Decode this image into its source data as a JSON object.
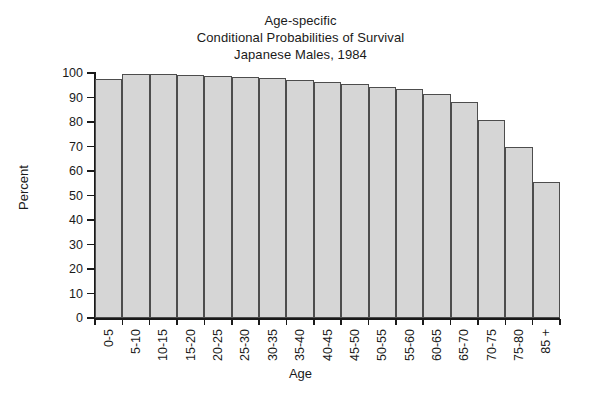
{
  "chart_data": {
    "type": "bar",
    "title": "Age-specific\nConditional Probabilities of Survival\nJapanese Males, 1984",
    "title_lines": [
      "Age-specific",
      "Conditional Probabilities of Survival",
      "Japanese Males, 1984"
    ],
    "xlabel": "Age",
    "ylabel": "Percent",
    "ylim": [
      0,
      100
    ],
    "ytick_labels": [
      "0",
      "10",
      "20",
      "30",
      "40",
      "50",
      "60",
      "70",
      "80",
      "90",
      "100"
    ],
    "ytick_values": [
      0,
      10,
      20,
      30,
      40,
      50,
      60,
      70,
      80,
      90,
      100
    ],
    "grid": false,
    "legend": null,
    "legend_position": "none",
    "categories": [
      "0-5",
      "5-10",
      "10-15",
      "15-20",
      "20-25",
      "25-30",
      "30-35",
      "35-40",
      "40-45",
      "45-50",
      "50-55",
      "55-60",
      "60-65",
      "65-70",
      "70-75",
      "75-80",
      "85 +"
    ],
    "values": [
      97.5,
      99.8,
      99.8,
      99.0,
      98.8,
      98.5,
      98.0,
      97.3,
      96.5,
      95.5,
      94.3,
      93.3,
      91.5,
      88.0,
      81.0,
      70.0,
      55.5
    ],
    "bar_fill_color": "#d6d6d6",
    "bar_edge_color": "#4d4d4d",
    "background_color": "#ffffff",
    "axis_color": "#1a1a1a"
  }
}
